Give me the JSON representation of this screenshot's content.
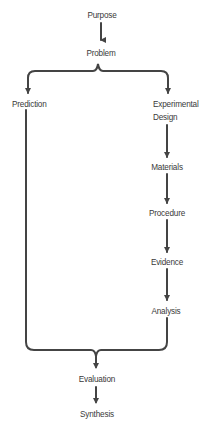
{
  "diagram": {
    "type": "flowchart",
    "line_color": "#444444",
    "text_color": "#3a3a3a",
    "nodes": {
      "purpose": "Purpose",
      "problem": "Problem",
      "prediction": "Prediction",
      "experimental_design_line1": "Experimental",
      "experimental_design_line2": "Design",
      "materials": "Materials",
      "procedure": "Procedure",
      "evidence": "Evidence",
      "analysis": "Analysis",
      "evaluation": "Evaluation",
      "synthesis": "Synthesis"
    },
    "edges": [
      [
        "Purpose",
        "Problem"
      ],
      [
        "Problem",
        "Prediction"
      ],
      [
        "Problem",
        "Experimental Design"
      ],
      [
        "Experimental Design",
        "Materials"
      ],
      [
        "Materials",
        "Procedure"
      ],
      [
        "Procedure",
        "Evidence"
      ],
      [
        "Evidence",
        "Analysis"
      ],
      [
        "Prediction",
        "Evaluation"
      ],
      [
        "Analysis",
        "Evaluation"
      ],
      [
        "Evaluation",
        "Synthesis"
      ]
    ]
  }
}
